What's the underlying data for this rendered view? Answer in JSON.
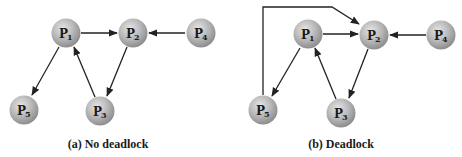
{
  "figure": {
    "panels": [
      {
        "id": "a",
        "caption": "(a) No deadlock",
        "nodes": [
          {
            "id": "P1",
            "label": "P",
            "sub": "1"
          },
          {
            "id": "P2",
            "label": "P",
            "sub": "2"
          },
          {
            "id": "P3",
            "label": "P",
            "sub": "3"
          },
          {
            "id": "P4",
            "label": "P",
            "sub": "4"
          },
          {
            "id": "P5",
            "label": "P",
            "sub": "5"
          }
        ],
        "edges": [
          {
            "from": "P1",
            "to": "P2"
          },
          {
            "from": "P4",
            "to": "P2"
          },
          {
            "from": "P1",
            "to": "P5"
          },
          {
            "from": "P2",
            "to": "P3"
          },
          {
            "from": "P3",
            "to": "P1"
          }
        ]
      },
      {
        "id": "b",
        "caption": "(b) Deadlock",
        "nodes": [
          {
            "id": "P1",
            "label": "P",
            "sub": "1"
          },
          {
            "id": "P2",
            "label": "P",
            "sub": "2"
          },
          {
            "id": "P3",
            "label": "P",
            "sub": "3"
          },
          {
            "id": "P4",
            "label": "P",
            "sub": "4"
          },
          {
            "id": "P5",
            "label": "P",
            "sub": "5"
          }
        ],
        "edges": [
          {
            "from": "P1",
            "to": "P2"
          },
          {
            "from": "P4",
            "to": "P2"
          },
          {
            "from": "P1",
            "to": "P5"
          },
          {
            "from": "P2",
            "to": "P3"
          },
          {
            "from": "P3",
            "to": "P1"
          },
          {
            "from": "P5",
            "to": "P2"
          }
        ]
      }
    ]
  }
}
